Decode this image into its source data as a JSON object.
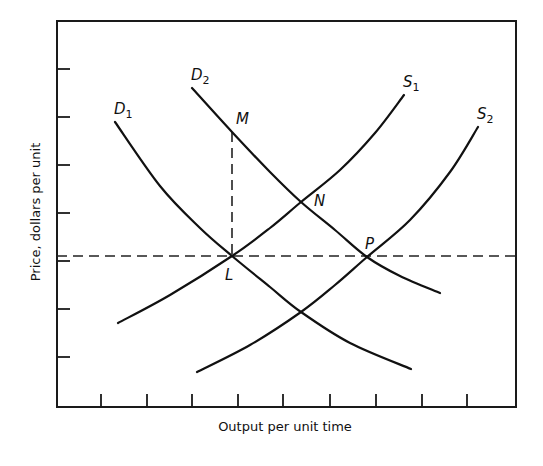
{
  "chart_data": {
    "type": "line",
    "title": "",
    "xlabel": "Output per unit time",
    "ylabel": "Price, dollars per unit",
    "grid": false,
    "legend": "none (curves labeled directly)",
    "x_ticks_count": 9,
    "y_ticks_count": 7,
    "tick_labels": "none",
    "series": [
      {
        "name": "D1",
        "kind": "demand",
        "label_main": "D",
        "label_sub": "1",
        "points_px": [
          [
            115,
            122
          ],
          [
            160,
            186
          ],
          [
            200,
            228
          ],
          [
            232,
            256
          ],
          [
            270,
            287
          ],
          [
            301,
            312
          ],
          [
            350,
            343
          ],
          [
            411,
            369
          ]
        ]
      },
      {
        "name": "D2",
        "kind": "demand",
        "label_main": "D",
        "label_sub": "2",
        "points_px": [
          [
            192,
            88
          ],
          [
            232,
            132
          ],
          [
            270,
            172
          ],
          [
            301,
            202
          ],
          [
            335,
            230
          ],
          [
            367,
            257
          ],
          [
            400,
            276
          ],
          [
            440,
            293
          ]
        ]
      },
      {
        "name": "S1",
        "kind": "supply",
        "label_main": "S",
        "label_sub": "1",
        "points_px": [
          [
            118,
            323
          ],
          [
            170,
            295
          ],
          [
            232,
            256
          ],
          [
            270,
            228
          ],
          [
            301,
            202
          ],
          [
            340,
            170
          ],
          [
            375,
            133
          ],
          [
            404,
            95
          ]
        ]
      },
      {
        "name": "S2",
        "kind": "supply",
        "label_main": "S",
        "label_sub": "2",
        "points_px": [
          [
            197,
            372
          ],
          [
            250,
            345
          ],
          [
            301,
            312
          ],
          [
            335,
            285
          ],
          [
            367,
            257
          ],
          [
            410,
            220
          ],
          [
            450,
            172
          ],
          [
            478,
            127
          ]
        ]
      }
    ],
    "points": [
      {
        "name": "L",
        "x_px": 232,
        "y_px": 256,
        "label_x": 225,
        "label_y": 280,
        "desc": "D1 x S1 equilibrium"
      },
      {
        "name": "M",
        "x_px": 232,
        "y_px": 132,
        "label_x": 236,
        "label_y": 124,
        "desc": "D2 at original quantity"
      },
      {
        "name": "N",
        "x_px": 301,
        "y_px": 202,
        "label_x": 314,
        "label_y": 206,
        "desc": "D2 x S1 equilibrium"
      },
      {
        "name": "P",
        "x_px": 367,
        "y_px": 257,
        "label_x": 365,
        "label_y": 249,
        "desc": "D2 x S2 equilibrium"
      }
    ],
    "reference_lines": [
      {
        "type": "horizontal-dashed",
        "y_px": 256,
        "from_x": 57,
        "to_x": 516,
        "desc": "price at L and P"
      },
      {
        "type": "vertical-dashed",
        "x_px": 232,
        "from_y": 132,
        "to_y": 256,
        "desc": "from M down to L"
      }
    ],
    "axes_px": {
      "left": 57,
      "top": 21,
      "right": 516,
      "bottom": 407
    },
    "y_ticks_px": [
      69,
      117,
      165,
      213,
      261,
      309,
      357
    ],
    "x_ticks_px": [
      101,
      147,
      192,
      238,
      283,
      330,
      376,
      422,
      467
    ]
  }
}
